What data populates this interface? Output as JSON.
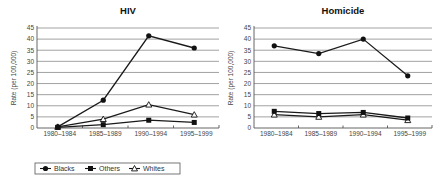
{
  "chart_data": [
    {
      "type": "line",
      "title": "HIV",
      "xlabel": "",
      "ylabel": "Rate (per 100,000)",
      "ylim": [
        0,
        45
      ],
      "yticks": [
        0,
        5,
        10,
        15,
        20,
        25,
        30,
        35,
        40,
        45
      ],
      "grid": true,
      "categories": [
        "1980–1984",
        "1985–1989",
        "1990–1994",
        "1995–1999"
      ],
      "series": [
        {
          "name": "Blacks",
          "marker": "filled-circle",
          "values": [
            0.5,
            12.5,
            41.5,
            36
          ]
        },
        {
          "name": "Others",
          "marker": "filled-square",
          "values": [
            0.3,
            1.5,
            3.5,
            2.5
          ]
        },
        {
          "name": "Whites",
          "marker": "open-triangle",
          "values": [
            0.5,
            4,
            10.5,
            6
          ]
        }
      ]
    },
    {
      "type": "line",
      "title": "Homicide",
      "xlabel": "",
      "ylabel": "Rate (per 100,000)",
      "ylim": [
        0,
        45
      ],
      "yticks": [
        0,
        5,
        10,
        15,
        20,
        25,
        30,
        35,
        40,
        45
      ],
      "grid": true,
      "categories": [
        "1980–1984",
        "1985–1989",
        "1990–1994",
        "1995–1999"
      ],
      "series": [
        {
          "name": "Blacks",
          "marker": "filled-circle",
          "values": [
            37,
            33.5,
            40,
            23.5
          ]
        },
        {
          "name": "Others",
          "marker": "filled-square",
          "values": [
            7.5,
            6.5,
            7,
            4.5
          ]
        },
        {
          "name": "Whites",
          "marker": "open-triangle",
          "values": [
            6,
            5,
            6,
            3.5
          ]
        }
      ]
    }
  ],
  "legend": {
    "position": "bottom-left",
    "entries": [
      {
        "label": "Blacks",
        "marker": "filled-circle"
      },
      {
        "label": "Others",
        "marker": "filled-square"
      },
      {
        "label": "Whites",
        "marker": "open-triangle"
      }
    ]
  },
  "colors": {
    "line": "#1a1a1a",
    "grid": "#8a8a8a",
    "background": "#ffffff"
  }
}
